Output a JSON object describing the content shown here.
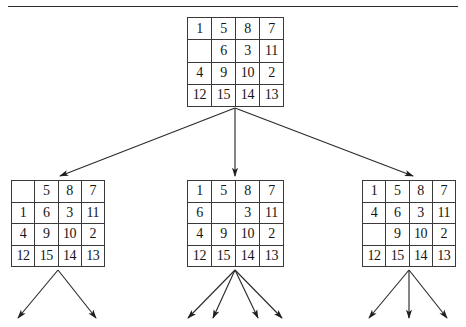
{
  "figure": {
    "name": "8-puzzle-search-tree",
    "background_color": "#ffffff",
    "line_color": "#2b2b2b",
    "grid_border_color": "#3a3a3a",
    "text_color": "#151515",
    "blank_label": ""
  },
  "divider": {
    "name": "top-horizontal-rule"
  },
  "nodes": {
    "root": {
      "id": "root",
      "label": "root-state",
      "blank_position": {
        "row": 1,
        "col": 0
      },
      "rows": [
        [
          "1",
          "5",
          "8",
          "7"
        ],
        [
          "",
          "6",
          "3",
          "11"
        ],
        [
          "4",
          "9",
          "10",
          "2"
        ],
        [
          "12",
          "15",
          "14",
          "13"
        ]
      ]
    },
    "child_left": {
      "id": "child-left",
      "label": "child-state-left",
      "blank_position": {
        "row": 0,
        "col": 0
      },
      "rows": [
        [
          "",
          "5",
          "8",
          "7"
        ],
        [
          "1",
          "6",
          "3",
          "11"
        ],
        [
          "4",
          "9",
          "10",
          "2"
        ],
        [
          "12",
          "15",
          "14",
          "13"
        ]
      ]
    },
    "child_middle": {
      "id": "child-middle",
      "label": "child-state-middle",
      "blank_position": {
        "row": 1,
        "col": 1
      },
      "rows": [
        [
          "1",
          "5",
          "8",
          "7"
        ],
        [
          "6",
          "",
          "3",
          "11"
        ],
        [
          "4",
          "9",
          "10",
          "2"
        ],
        [
          "12",
          "15",
          "14",
          "13"
        ]
      ]
    },
    "child_right": {
      "id": "child-right",
      "label": "child-state-right",
      "blank_position": {
        "row": 2,
        "col": 0
      },
      "rows": [
        [
          "1",
          "5",
          "8",
          "7"
        ],
        [
          "4",
          "6",
          "3",
          "11"
        ],
        [
          "",
          "9",
          "10",
          "2"
        ],
        [
          "12",
          "15",
          "14",
          "13"
        ]
      ]
    }
  },
  "edges": {
    "from_root": [
      {
        "name": "edge-root-to-left",
        "x1": 235,
        "y1": 108,
        "x2": 60,
        "y2": 176
      },
      {
        "name": "edge-root-to-middle",
        "x1": 235,
        "y1": 108,
        "x2": 235,
        "y2": 176
      },
      {
        "name": "edge-root-to-right",
        "x1": 235,
        "y1": 108,
        "x2": 413,
        "y2": 176
      }
    ],
    "below_left": [
      {
        "name": "edge-left-child-1",
        "x1": 58,
        "y1": 270,
        "x2": 18,
        "y2": 318
      },
      {
        "name": "edge-left-child-2",
        "x1": 58,
        "y1": 270,
        "x2": 96,
        "y2": 318
      }
    ],
    "below_middle": [
      {
        "name": "edge-middle-child-1",
        "x1": 235,
        "y1": 270,
        "x2": 188,
        "y2": 318
      },
      {
        "name": "edge-middle-child-2",
        "x1": 235,
        "y1": 270,
        "x2": 213,
        "y2": 318
      },
      {
        "name": "edge-middle-child-3",
        "x1": 235,
        "y1": 270,
        "x2": 258,
        "y2": 318
      },
      {
        "name": "edge-middle-child-4",
        "x1": 235,
        "y1": 270,
        "x2": 282,
        "y2": 318
      }
    ],
    "below_right": [
      {
        "name": "edge-right-child-1",
        "x1": 409,
        "y1": 270,
        "x2": 369,
        "y2": 318
      },
      {
        "name": "edge-right-child-2",
        "x1": 409,
        "y1": 270,
        "x2": 409,
        "y2": 318
      },
      {
        "name": "edge-right-child-3",
        "x1": 409,
        "y1": 270,
        "x2": 447,
        "y2": 318
      }
    ]
  }
}
